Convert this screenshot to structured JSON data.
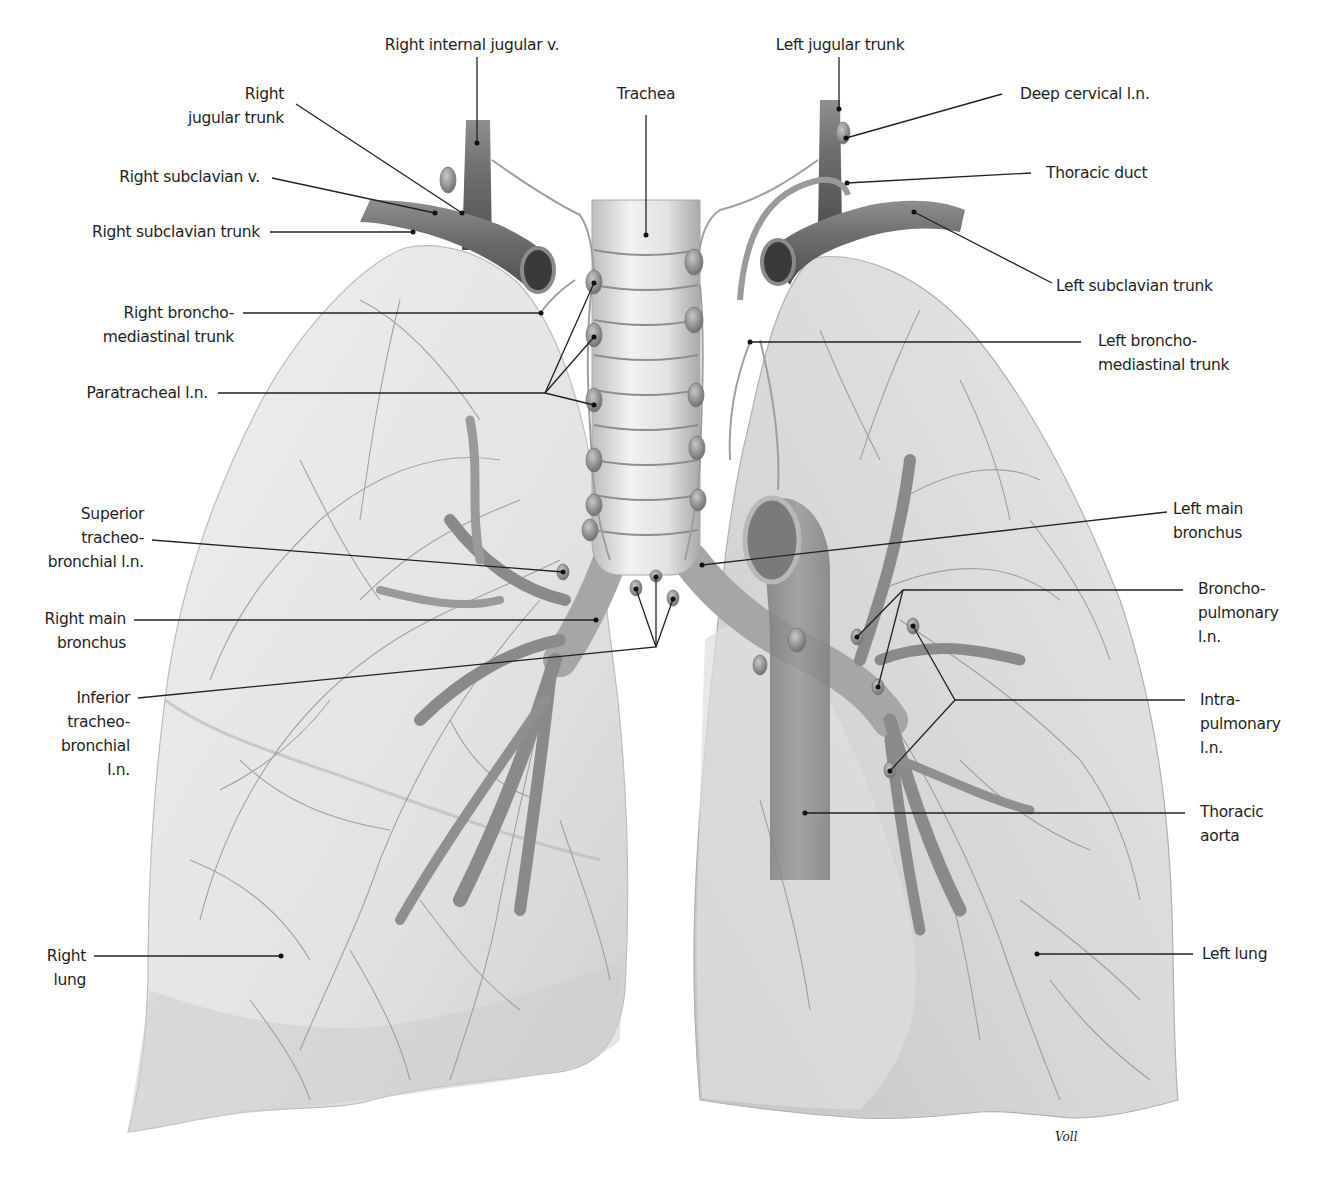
{
  "figure": {
    "signature": "Voll",
    "colors": {
      "background": "#ffffff",
      "lung_fill": "#e6e6e6",
      "lung_shade": "#c9c9c9",
      "vessel": "#7a7a7a",
      "bronchus": "#8a8a8a",
      "leader_line": "#222222",
      "label_text": "#1e1e1e"
    }
  },
  "labels": {
    "right_internal_jugular_v": "Right internal jugular v.",
    "right_jugular_trunk": "Right\njugular trunk",
    "right_subclavian_v": "Right subclavian v.",
    "right_subclavian_trunk": "Right subclavian trunk",
    "right_bronchomediastinal_trunk": "Right broncho-\nmediastinal trunk",
    "paratracheal_ln": "Paratracheal l.n.",
    "superior_tracheobronchial_ln": "Superior\ntracheo-\nbronchial l.n.",
    "right_main_bronchus": "Right main\nbronchus",
    "inferior_tracheobronchial_ln": "Inferior\ntracheo-\nbronchial\nl.n.",
    "right_lung": "Right\nlung",
    "trachea": "Trachea",
    "left_jugular_trunk": "Left jugular trunk",
    "deep_cervical_ln": "Deep cervical l.n.",
    "thoracic_duct": "Thoracic duct",
    "left_subclavian_trunk": "Left subclavian trunk",
    "left_bronchomediastinal_trunk": "Left broncho-\nmediastinal trunk",
    "left_main_bronchus": "Left main\nbronchus",
    "bronchopulmonary_ln": "Broncho-\npulmonary\nl.n.",
    "intrapulmonary_ln": "Intra-\npulmonary\nl.n.",
    "thoracic_aorta": "Thoracic\naorta",
    "left_lung": "Left lung"
  }
}
